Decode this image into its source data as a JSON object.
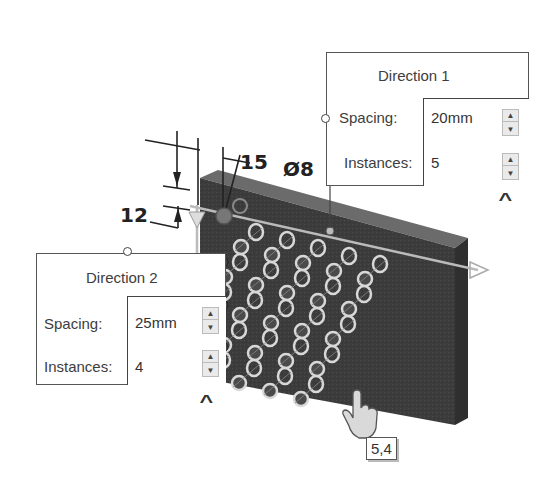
{
  "direction1": {
    "title": "Direction 1",
    "spacing_label": "Spacing:",
    "spacing_value": "20mm",
    "instances_label": "Instances:",
    "instances_value": "5",
    "collapse_icon": "chevron-up-icon"
  },
  "direction2": {
    "title": "Direction 2",
    "spacing_label": "Spacing:",
    "spacing_value": "25mm",
    "instances_label": "Instances:",
    "instances_value": "4",
    "collapse_icon": "chevron-up-icon"
  },
  "dimensions": {
    "offset_x": "15",
    "offset_y": "12",
    "hole_diameter": "Ø8"
  },
  "cursor_tooltip": "5,4",
  "spinner": {
    "up_glyph": "▲",
    "down_glyph": "▼"
  },
  "chevron_glyph": "^",
  "colors": {
    "part_face": "#3e3e3e",
    "part_top": "#6a6a6a",
    "hole_ring": "#d8d8d8",
    "seed_hole": "#777777"
  }
}
